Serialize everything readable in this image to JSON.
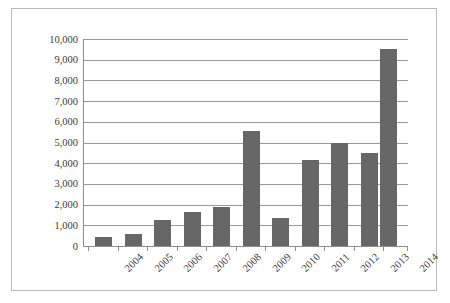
{
  "chart_data": {
    "type": "bar",
    "title": "",
    "subtitle": "",
    "xlabel": "",
    "ylabel": "",
    "categories": [
      "2004",
      "2005",
      "2006",
      "2007",
      "2008",
      "2009",
      "2010",
      "2011",
      "2012",
      "2013",
      "2014"
    ],
    "values": [
      430,
      580,
      1270,
      1620,
      1880,
      5570,
      1370,
      4150,
      5000,
      4510,
      9500
    ],
    "ylim": [
      0,
      10000
    ],
    "ytick_step": 1000,
    "ytick_labels": [
      "10,000",
      "9,000",
      "8,000",
      "7,000",
      "6,000",
      "5,000",
      "4,000",
      "3,000",
      "2,000",
      "1,000",
      "0"
    ],
    "ytick_values": [
      10000,
      9000,
      8000,
      7000,
      6000,
      5000,
      4000,
      3000,
      2000,
      1000,
      0
    ],
    "grid": true,
    "grid_axis": "y",
    "legend": false,
    "legend_position": "none",
    "xtick_rotation": -45,
    "series": [
      {
        "name": "",
        "values": [
          430,
          580,
          1270,
          1620,
          1880,
          5570,
          1370,
          4150,
          5000,
          4510,
          9500
        ]
      }
    ]
  },
  "style": {
    "bar_color": "#676767",
    "gridline_color": "#9a9a9a",
    "axis_color": "#8d8d8d",
    "frame_color": "#b9b9b9",
    "text_color": "#3a3a3a",
    "background_color": "#ffffff"
  }
}
